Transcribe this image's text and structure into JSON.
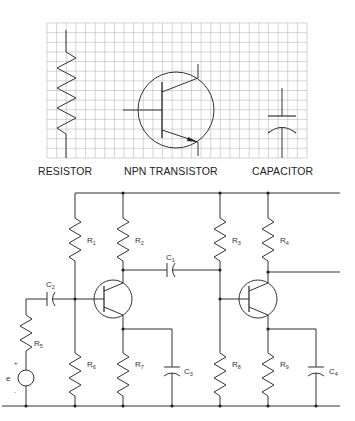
{
  "legend": {
    "symbols": [
      {
        "id": "resistor",
        "caption": "RESISTOR"
      },
      {
        "id": "npn",
        "caption": "NPN TRANSISTOR"
      },
      {
        "id": "capacitor",
        "caption": "CAPACITOR"
      }
    ],
    "grid": {
      "cols": 27,
      "rows": 14,
      "color": "#b8b8b8"
    }
  },
  "circuit": {
    "source": {
      "label": "e",
      "plus": "+",
      "minus": "-"
    },
    "resistors": [
      {
        "name": "R",
        "sub": "1"
      },
      {
        "name": "R",
        "sub": "2"
      },
      {
        "name": "R",
        "sub": "3"
      },
      {
        "name": "R",
        "sub": "4"
      },
      {
        "name": "R",
        "sub": "5"
      },
      {
        "name": "R",
        "sub": "6"
      },
      {
        "name": "R",
        "sub": "7"
      },
      {
        "name": "R",
        "sub": "8"
      },
      {
        "name": "R",
        "sub": "9"
      }
    ],
    "capacitors": [
      {
        "name": "C",
        "sub": "1"
      },
      {
        "name": "C",
        "sub": "2"
      },
      {
        "name": "C",
        "sub": "3"
      },
      {
        "name": "C",
        "sub": "4"
      }
    ],
    "transistors": [
      {
        "name": "Q1",
        "type": "NPN"
      },
      {
        "name": "Q2",
        "type": "NPN"
      }
    ]
  }
}
